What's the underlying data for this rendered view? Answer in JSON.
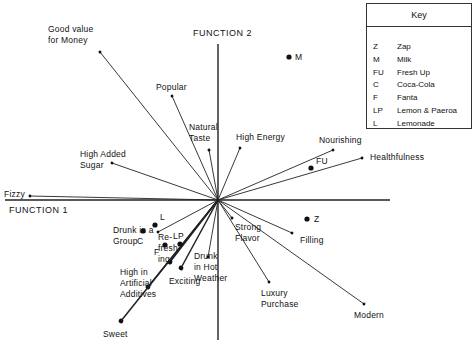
{
  "chart_data": {
    "type": "scatter",
    "title": "",
    "xlabel": "FUNCTION 1",
    "ylabel": "FUNCTION 2",
    "origin": [
      0,
      0
    ],
    "note": "Biplot: attribute vectors from origin and brand positions in discriminant function space (arbitrary units, origin = 0,0; +x right, +y up).",
    "attributes": [
      {
        "name": "Good value for Money",
        "label_lines": [
          "Good value",
          "for Money"
        ],
        "x": -1.18,
        "y": 1.48
      },
      {
        "name": "Popular",
        "label_lines": [
          "Popular"
        ],
        "x": -0.46,
        "y": 1.04
      },
      {
        "name": "Natural Taste",
        "label_lines": [
          "Natural",
          "Taste"
        ],
        "x": -0.09,
        "y": 0.5
      },
      {
        "name": "High Energy",
        "label_lines": [
          "High Energy"
        ],
        "x": 0.22,
        "y": 0.52
      },
      {
        "name": "Nourishing",
        "label_lines": [
          "Nourishing"
        ],
        "x": 1.15,
        "y": 0.5
      },
      {
        "name": "Healthfulness",
        "label_lines": [
          "Healthfulness"
        ],
        "x": 1.44,
        "y": 0.42
      },
      {
        "name": "High Added Sugar",
        "label_lines": [
          "High Added",
          "Sugar"
        ],
        "x": -1.06,
        "y": 0.37
      },
      {
        "name": "Fizzy",
        "label_lines": [
          "Fizzy"
        ],
        "x": -1.88,
        "y": 0.04
      },
      {
        "name": "Drunk in a Group",
        "label_lines": [
          "Drunk in a",
          "Group"
        ],
        "x": -0.6,
        "y": -0.32
      },
      {
        "name": "Strong Flavor",
        "label_lines": [
          "Strong",
          "Flavor"
        ],
        "x": 0.14,
        "y": -0.18
      },
      {
        "name": "Filling",
        "label_lines": [
          "Filling"
        ],
        "x": 0.74,
        "y": -0.33
      },
      {
        "name": "Modern",
        "label_lines": [
          "Modern"
        ],
        "x": 1.46,
        "y": -1.04
      },
      {
        "name": "Luxury Purchase",
        "label_lines": [
          "Luxury",
          "Purchase"
        ],
        "x": 0.51,
        "y": -0.82
      },
      {
        "name": "Drunk in Hot Weather",
        "label_lines": [
          "Drunk",
          "in Hot",
          "Weather"
        ],
        "x": -0.1,
        "y": -0.57
      },
      {
        "name": "Refreshing",
        "label_lines": [
          "Re-",
          "fresh-",
          "ing"
        ],
        "x": -0.48,
        "y": -0.62
      },
      {
        "name": "Exciting",
        "label_lines": [
          "Exciting"
        ],
        "x": -0.37,
        "y": -0.68
      },
      {
        "name": "High in Artificial Additives",
        "label_lines": [
          "High in",
          "Artificial",
          "Additives"
        ],
        "x": -0.7,
        "y": -0.87
      },
      {
        "name": "Sweet",
        "label_lines": [
          "Sweet"
        ],
        "x": -0.97,
        "y": -1.21
      }
    ],
    "brands": [
      {
        "code": "M",
        "x": 0.71,
        "y": 1.43
      },
      {
        "code": "FU",
        "x": 0.93,
        "y": 0.32
      },
      {
        "code": "Z",
        "x": 0.89,
        "y": -0.19
      },
      {
        "code": "L",
        "x": -0.63,
        "y": -0.25
      },
      {
        "code": "C",
        "x": -0.75,
        "y": -0.31
      },
      {
        "code": "F",
        "x": -0.53,
        "y": -0.45
      },
      {
        "code": "LP",
        "x": -0.38,
        "y": -0.44
      }
    ],
    "legend": {
      "title": "Key",
      "placement": "top-right",
      "entries": [
        {
          "code": "Z",
          "name": "Zap"
        },
        {
          "code": "M",
          "name": "Milk"
        },
        {
          "code": "FU",
          "name": "Fresh Up"
        },
        {
          "code": "C",
          "name": "Coca-Cola"
        },
        {
          "code": "F",
          "name": "Fanta"
        },
        {
          "code": "LP",
          "name": "Lemon & Paeroa"
        },
        {
          "code": "L",
          "name": "Lemonade"
        }
      ]
    }
  },
  "axes": {
    "function1_label": "FUNCTION 1",
    "function2_label": "FUNCTION 2"
  },
  "colors": {
    "ink": "#111111",
    "background": "#ffffff"
  }
}
